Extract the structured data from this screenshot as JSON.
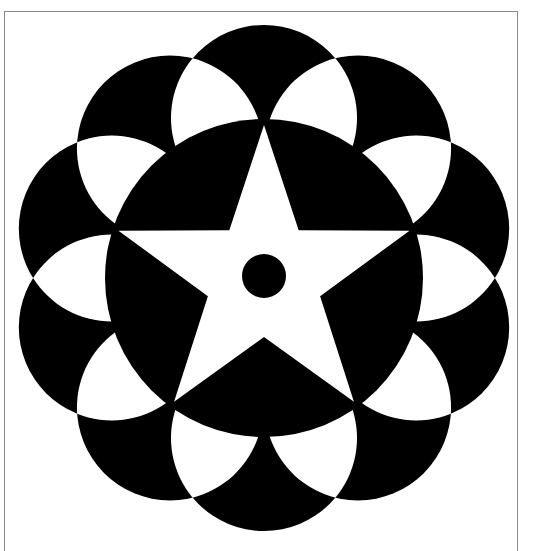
{
  "figure": {
    "colors": {
      "ink": "#000000",
      "paper": "#ffffff",
      "frame": "#8a8a8a"
    },
    "geometry": {
      "center": [
        264,
        278
      ],
      "petal_count": 10,
      "petal_ring_radius": 160,
      "petal_radius": 93,
      "petal_start_angle_deg": -90,
      "inner_disc_radius": 159,
      "star_points": 5,
      "star_outer_radius": 153,
      "star_inner_radius": 59,
      "center_dot_radius": 22
    }
  }
}
